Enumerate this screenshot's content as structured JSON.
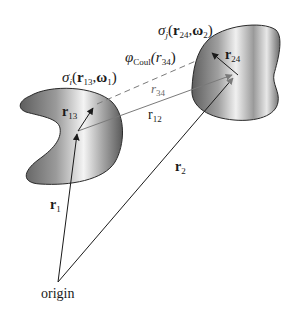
{
  "diagram": {
    "labels": {
      "origin": "origin",
      "r1": {
        "base": "r",
        "sub": "1"
      },
      "r2": {
        "base": "r",
        "sub": "2"
      },
      "r12": {
        "base": "r",
        "sub": "12"
      },
      "r13": {
        "base": "r",
        "sub": "13"
      },
      "r24": {
        "base": "r",
        "sub": "24"
      },
      "r34": {
        "base": "r",
        "sub": "34"
      },
      "phi": {
        "symbol": "φ",
        "sub": "Coul",
        "arg": "(r",
        "arg_sub": "34",
        "close": ")"
      },
      "sigma_i": {
        "symbol": "σ",
        "sub": "i",
        "open": "(",
        "r": "r",
        "r_sub": "13",
        "comma": ",",
        "w": "ω",
        "w_sub": "1",
        "close": ")"
      },
      "sigma_j": {
        "symbol": "σ",
        "sub": "j",
        "open": "(",
        "r": "r",
        "r_sub": "24",
        "comma": ",",
        "w": "ω",
        "w_sub": "2",
        "close": ")"
      }
    },
    "colors": {
      "line": "#1a1a1a",
      "gray_line": "#7a7a7a",
      "blob_dark": "#5a5a5a",
      "blob_light": "#f2f2f2"
    }
  }
}
